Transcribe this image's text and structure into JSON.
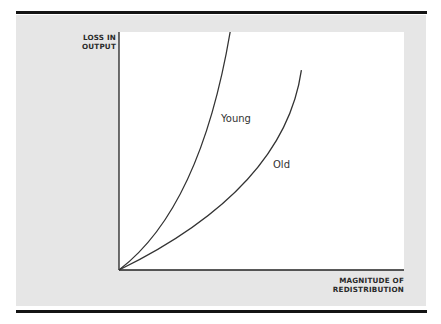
{
  "chart_data": {
    "type": "line",
    "title": "",
    "ylabel_lines": [
      "LOSS IN",
      "OUTPUT"
    ],
    "xlabel_lines": [
      "MAGNITUDE OF",
      "REDISTRIBUTION"
    ],
    "grid": false,
    "axis_ticks": "none",
    "series": [
      {
        "name": "Young",
        "shape": "convex, steeper",
        "points": [
          [
            0,
            0
          ],
          [
            0.24,
            0.38
          ],
          [
            0.39,
            1.0
          ]
        ]
      },
      {
        "name": "Old",
        "shape": "convex, flatter",
        "points": [
          [
            0,
            0
          ],
          [
            0.45,
            0.38
          ],
          [
            0.64,
            0.84
          ]
        ]
      }
    ],
    "xlim": [
      0,
      1
    ],
    "ylim": [
      0,
      1
    ]
  }
}
